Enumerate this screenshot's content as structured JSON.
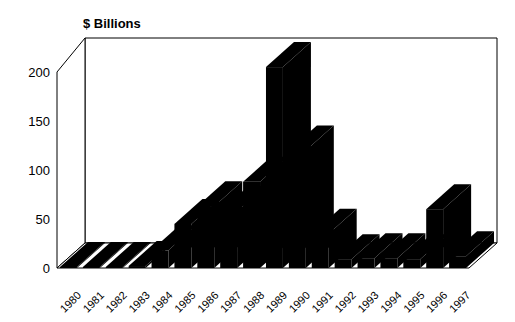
{
  "chart_data": {
    "type": "bar",
    "title": "$ Billions",
    "xlabel": "",
    "ylabel": "$ Billions",
    "ylim": [
      0,
      220
    ],
    "yticks": [
      0,
      50,
      100,
      150,
      200
    ],
    "ytick_labels": [
      "0",
      "50",
      "100",
      "150",
      "200"
    ],
    "grid": false,
    "legend": "none",
    "three_d": true,
    "categories": [
      "1980",
      "1981",
      "1982",
      "1983",
      "1984",
      "1985",
      "1986",
      "1987",
      "1988",
      "1989",
      "1990",
      "1991",
      "1992",
      "1993",
      "1994",
      "1995",
      "1996",
      "1997"
    ],
    "values": [
      1,
      1,
      1,
      2,
      18,
      45,
      63,
      58,
      88,
      205,
      120,
      35,
      9,
      10,
      10,
      9,
      60,
      12
    ],
    "series": [
      {
        "name": "$ Billions",
        "color": "#000000",
        "values": [
          1,
          1,
          1,
          2,
          18,
          45,
          63,
          58,
          88,
          205,
          120,
          35,
          9,
          10,
          10,
          9,
          60,
          12
        ]
      }
    ]
  },
  "axis": {
    "title": "$ Billions",
    "y_tick_0": "0",
    "y_tick_1": "50",
    "y_tick_2": "100",
    "y_tick_3": "150",
    "y_tick_4": "200"
  }
}
